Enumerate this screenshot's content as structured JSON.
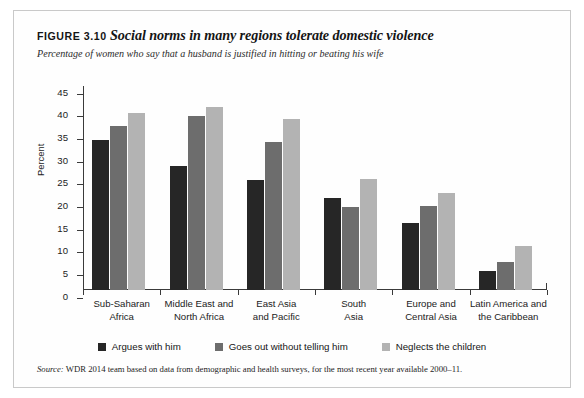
{
  "figure": {
    "number": "FIGURE 3.10",
    "title": "Social norms in many regions tolerate domestic violence",
    "subtitle": "Percentage of women who say that a husband is justified in hitting or beating his wife",
    "source_label": "Source:",
    "source_text": " WDR 2014 team based on data from demographic and health surveys, for the most recent year available 2000–11."
  },
  "colors": {
    "series_dark": "#262626",
    "series_mid": "#6d6d6d",
    "series_light": "#b3b3b3",
    "axis": "#3a3a3a",
    "frame": "#c9c9c9",
    "text": "#1b1b1b"
  },
  "chart_data": {
    "type": "bar",
    "title": "Social norms in many regions tolerate domestic violence",
    "subtitle": "Percentage of women who say that a husband is justified in hitting or beating his wife",
    "xlabel": "",
    "ylabel": "Percent",
    "ylim": [
      0,
      45
    ],
    "ytick_step": 5,
    "yticks": [
      0,
      5,
      10,
      15,
      20,
      25,
      30,
      35,
      40,
      45
    ],
    "grid": false,
    "legend_position": "bottom",
    "categories": [
      "Sub-Saharan Africa",
      "Middle East and North Africa",
      "East Asia and Pacific",
      "South Asia",
      "Europe and Central Asia",
      "Latin America and the Caribbean"
    ],
    "category_lines": [
      [
        "Sub-Saharan",
        "Africa"
      ],
      [
        "Middle East and",
        "North Africa"
      ],
      [
        "East Asia",
        "and Pacific"
      ],
      [
        "South",
        "Asia"
      ],
      [
        "Europe and",
        "Central Asia"
      ],
      [
        "Latin America and",
        "the Caribbean"
      ]
    ],
    "series": [
      {
        "name": "Argues with him",
        "color": "#262626",
        "values": [
          33.0,
          27.4,
          24.3,
          20.3,
          14.7,
          4.2
        ]
      },
      {
        "name": "Goes out without telling him",
        "color": "#6d6d6d",
        "values": [
          36.1,
          38.4,
          32.7,
          18.4,
          18.6,
          6.2
        ]
      },
      {
        "name": "Neglects the children",
        "color": "#b3b3b3",
        "values": [
          39.1,
          40.4,
          37.8,
          24.5,
          21.3,
          9.8
        ]
      }
    ]
  }
}
